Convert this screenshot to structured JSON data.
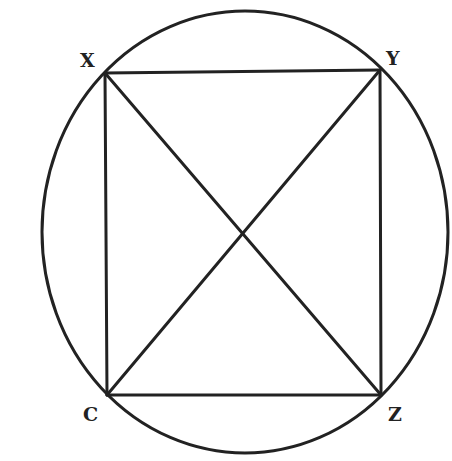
{
  "diagram": {
    "type": "inscribed-quadrilateral",
    "colors": {
      "stroke": "#222222",
      "background": "#ffffff"
    },
    "ellipse": {
      "cx": 245,
      "cy": 232,
      "rx": 203,
      "ry": 221
    },
    "vertices": {
      "X": {
        "label": "X",
        "x": 105,
        "y": 73
      },
      "Y": {
        "label": "Y",
        "x": 380,
        "y": 70
      },
      "Z": {
        "label": "Z",
        "x": 381,
        "y": 395
      },
      "C": {
        "label": "C",
        "x": 107,
        "y": 395
      }
    },
    "edges": [
      [
        "X",
        "Y"
      ],
      [
        "Y",
        "Z"
      ],
      [
        "Z",
        "C"
      ],
      [
        "C",
        "X"
      ]
    ],
    "diagonals": [
      [
        "X",
        "Z"
      ],
      [
        "Y",
        "C"
      ]
    ]
  }
}
